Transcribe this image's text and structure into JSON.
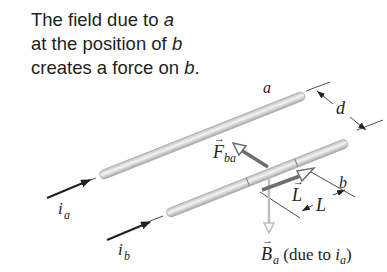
{
  "caption": {
    "line1_text": "The field due to ",
    "line1_var": "a",
    "line2_text": "at the position of ",
    "line2_var": "b",
    "line3_text": "creates a force on ",
    "line3_var": "b",
    "line3_end": "."
  },
  "labels": {
    "wire_a": "a",
    "wire_b": "b",
    "separation": "d",
    "current_a": "i",
    "current_a_sub": "a",
    "current_b": "i",
    "current_b_sub": "b",
    "force": "F",
    "force_sub": "ba",
    "length_vector": "L",
    "length_dim": "L",
    "field": "B",
    "field_sub": "a",
    "field_note_open": " (due to ",
    "field_note_var": "i",
    "field_note_sub": "a",
    "field_note_close": ")"
  },
  "colors": {
    "text": "#231f20",
    "wire_fill": "#e6e6e6",
    "wire_edge": "#a7a9ac",
    "force_arrow": "#6d6e71",
    "field_arrow": "#bcbec0",
    "length_arrow": "#6d6e71"
  }
}
